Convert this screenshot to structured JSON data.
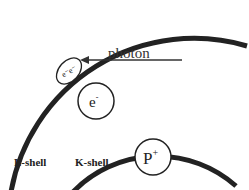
{
  "diagram": {
    "type": "atomic-shell-photoelectric",
    "colors": {
      "line": "#222222",
      "background": "#ffffff",
      "text": "#222222"
    },
    "shells": [
      {
        "id": "L",
        "label": "L-shell"
      },
      {
        "id": "K",
        "label": "K-shell"
      }
    ],
    "nucleus": {
      "label_main": "P",
      "label_sup": "+"
    },
    "electron": {
      "label_main": "e",
      "label_sup": "-"
    },
    "ejected_electrons": {
      "label": "e⁻e⁻"
    },
    "photon": {
      "label": "photon",
      "arrow_direction": "left"
    }
  }
}
